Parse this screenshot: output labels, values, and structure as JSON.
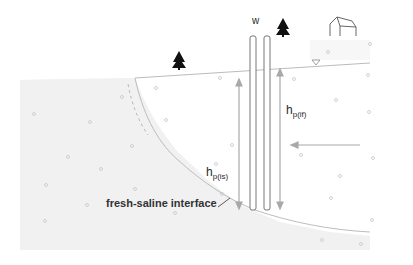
{
  "diagram": {
    "labels": {
      "well": "w",
      "h_fresh_base": "h",
      "h_fresh_sub": "p(if)",
      "h_saline_base": "h",
      "h_saline_sub": "p(is)",
      "interface": "fresh-saline interface"
    },
    "icons": {
      "tree_left": "tree-icon",
      "tree_right": "tree-icon",
      "house": "house-icon",
      "water_table": "water-table-triangle-icon"
    },
    "colors": {
      "freshwater": "#ffffff",
      "saline": "#f1f1f1",
      "outline": "#999999",
      "arrow": "#a8a8a8",
      "text": "#2a2a2a",
      "well": "#777777"
    }
  }
}
